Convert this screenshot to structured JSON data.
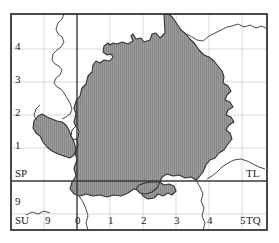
{
  "map": {
    "title": "Ordnance Survey grid map with shaded administrative area",
    "frame": {
      "x": 11,
      "y": 14,
      "width": 256,
      "height": 216
    },
    "colors": {
      "background": "#ffffff",
      "frame": "#2b2b2b",
      "major_grid": "#3a3a3a",
      "minor_grid": "#c9c9c9",
      "shade_fill": "#9a9a9a",
      "shade_hatch": "#7d7d7d",
      "shade_outline": "#333333",
      "coastline": "#2b2b2b",
      "label": "#1a1a1a"
    },
    "grid": {
      "origin_x_px": 77,
      "origin_y_px": 181,
      "cell_px": 33,
      "minor_gridlines": true,
      "major_line_easting": "0",
      "major_line_northing": "0"
    },
    "square_labels": [
      {
        "name": "grid-square-sp",
        "text": "SP",
        "x": 15,
        "y": 168
      },
      {
        "name": "grid-square-tl",
        "text": "TL",
        "x": 246,
        "y": 168
      },
      {
        "name": "grid-square-su",
        "text": "SU",
        "x": 15,
        "y": 215
      },
      {
        "name": "grid-square-tq",
        "text": "TQ",
        "x": 246,
        "y": 215
      }
    ],
    "y_axis": {
      "name": "northing-ticks",
      "ticks": [
        {
          "label": "4",
          "x": 15,
          "y": 41
        },
        {
          "label": "3",
          "x": 15,
          "y": 74
        },
        {
          "label": "2",
          "x": 15,
          "y": 107
        },
        {
          "label": "1",
          "x": 15,
          "y": 140
        },
        {
          "label": "9",
          "x": 15,
          "y": 196
        }
      ]
    },
    "x_axis": {
      "name": "easting-ticks",
      "ticks": [
        {
          "label": "9",
          "x": 45,
          "y": 215
        },
        {
          "label": "0",
          "x": 75,
          "y": 215
        },
        {
          "label": "1",
          "x": 108,
          "y": 215
        },
        {
          "label": "2",
          "x": 141,
          "y": 215
        },
        {
          "label": "3",
          "x": 174,
          "y": 215
        },
        {
          "label": "4",
          "x": 207,
          "y": 215
        },
        {
          "label": "5",
          "x": 240,
          "y": 215
        }
      ]
    }
  }
}
